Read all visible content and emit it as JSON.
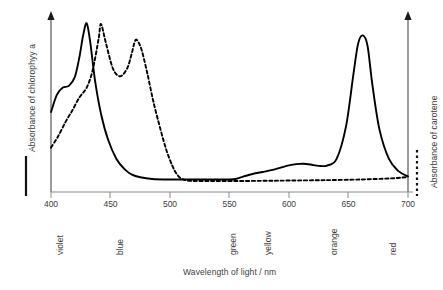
{
  "chart_data": {
    "type": "line",
    "title": "",
    "xlabel": "Wavelength of light / nm",
    "xlim": [
      400,
      700
    ],
    "xticks": [
      400,
      450,
      500,
      550,
      600,
      650,
      700
    ],
    "grid": false,
    "legend_position": "axis-labels",
    "axes": {
      "left": {
        "label": "Absorbance of chlorophyy a",
        "line_style": "solid",
        "arrow": true
      },
      "right": {
        "label": "Absorbance of carotene",
        "line_style": "dashed",
        "arrow": true
      }
    },
    "band_labels": [
      {
        "text": "violet",
        "wavelength": 400
      },
      {
        "text": "blue",
        "wavelength": 450
      },
      {
        "text": "green",
        "wavelength": 545
      },
      {
        "text": "yellow",
        "wavelength": 575
      },
      {
        "text": "orange",
        "wavelength": 630
      },
      {
        "text": "red",
        "wavelength": 680
      }
    ],
    "series": [
      {
        "name": "Absorbance of chlorophyy a",
        "style": "solid",
        "color": "#000000",
        "axis": "left",
        "x": [
          400,
          405,
          410,
          415,
          420,
          424,
          427,
          430,
          433,
          437,
          442,
          448,
          455,
          462,
          468,
          475,
          485,
          500,
          515,
          530,
          545,
          555,
          562,
          570,
          578,
          588,
          598,
          606,
          612,
          618,
          625,
          632,
          640,
          648,
          654,
          658,
          662,
          666,
          670,
          676,
          684,
          692,
          700
        ],
        "y": [
          0.46,
          0.56,
          0.6,
          0.61,
          0.66,
          0.78,
          0.9,
          0.97,
          0.86,
          0.64,
          0.45,
          0.3,
          0.19,
          0.13,
          0.1,
          0.085,
          0.075,
          0.072,
          0.072,
          0.072,
          0.072,
          0.075,
          0.09,
          0.105,
          0.115,
          0.13,
          0.15,
          0.16,
          0.162,
          0.158,
          0.15,
          0.152,
          0.19,
          0.38,
          0.67,
          0.85,
          0.9,
          0.84,
          0.62,
          0.36,
          0.19,
          0.12,
          0.09
        ]
      },
      {
        "name": "Absorbance of carotene",
        "style": "dashed",
        "color": "#000000",
        "axis": "right",
        "x": [
          400,
          406,
          412,
          418,
          424,
          430,
          435,
          440,
          442,
          446,
          452,
          458,
          464,
          468,
          470,
          472,
          476,
          481,
          486,
          492,
          497,
          502,
          506,
          510,
          516,
          525,
          545,
          575,
          600,
          630,
          660,
          685,
          695,
          700
        ],
        "y": [
          0.255,
          0.32,
          0.4,
          0.47,
          0.545,
          0.6,
          0.7,
          0.88,
          0.965,
          0.86,
          0.71,
          0.665,
          0.71,
          0.8,
          0.855,
          0.875,
          0.82,
          0.68,
          0.52,
          0.36,
          0.24,
          0.15,
          0.1,
          0.075,
          0.065,
          0.063,
          0.063,
          0.064,
          0.066,
          0.068,
          0.072,
          0.078,
          0.083,
          0.086
        ]
      }
    ]
  }
}
